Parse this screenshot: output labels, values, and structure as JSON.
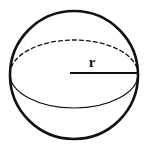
{
  "figure": {
    "name": "sphere-radius-diagram",
    "type": "geometry-diagram",
    "shape": "sphere",
    "background_color": "#ffffff",
    "stroke_color": "#111111",
    "labels": {
      "radius": "r"
    },
    "geometry": {
      "canvas": {
        "width": 147,
        "height": 152
      },
      "circle": {
        "center_x": 74,
        "center_y": 75,
        "radius": 64,
        "stroke_width": 2.6,
        "stroke_style": "solid"
      },
      "equator_ellipse": {
        "center_x": 74,
        "center_y": 74,
        "radius_x": 64,
        "radius_y": 34,
        "back_half": {
          "position": "upper",
          "stroke_style": "dashed",
          "dash_pattern": "4,3",
          "stroke_width": 1.3
        },
        "front_half": {
          "position": "lower",
          "stroke_style": "solid",
          "stroke_width": 1.2
        }
      },
      "radius_line": {
        "x1": 70,
        "y1": 73,
        "x2": 138,
        "y2": 73,
        "stroke_width": 2.2,
        "stroke_style": "solid"
      },
      "radius_label_position": {
        "x": 92,
        "y": 67
      }
    }
  }
}
